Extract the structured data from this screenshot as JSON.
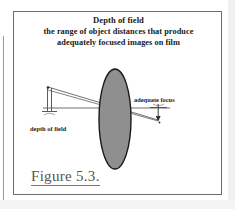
{
  "figure": {
    "title": {
      "line1": "Depth of field",
      "line2": "the range of object distances that produce",
      "line3": "adequately focused images on film"
    },
    "caption": "Figure 5.3.",
    "labels": {
      "depth_of_field": "depth of field",
      "adequate_focus": "adequate focus"
    },
    "colors": {
      "frame_border": "#6d6d6d",
      "lens_fill": "#8f8f8f",
      "lens_stroke": "#1a1a1a",
      "line": "#4a4a4a",
      "text": "#1b1b1b",
      "caption_text": "#555555",
      "background": "#ffffff"
    },
    "geometry": {
      "optical_axis_y": 96,
      "optical_axis_x_start": 29,
      "optical_axis_x_end": 156,
      "lens_center_x": 101,
      "lens_center_y": 107,
      "lens_rx": 16,
      "lens_ry": 50,
      "object_point_x": 34,
      "object_point_y": 75,
      "image_point_x": 144,
      "image_point_y": 108
    }
  }
}
